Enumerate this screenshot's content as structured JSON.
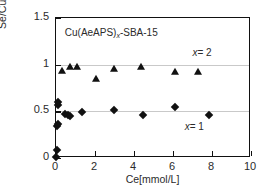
{
  "chart_data": {
    "type": "scatter",
    "title": "Cu(AeAPS)x-SBA-15",
    "title_base": "Cu(AeAPS)",
    "title_sub": "x",
    "title_tail": "-SBA-15",
    "xlabel": "Ce[mmol/L]",
    "ylabel": "Se/Cu[mol/mol]",
    "xlim": [
      0,
      10
    ],
    "ylim": [
      0,
      1.5
    ],
    "xticks": [
      0,
      2,
      4,
      6,
      8,
      10
    ],
    "xticklabels": [
      "0",
      "2",
      "4",
      "6",
      "8",
      "10"
    ],
    "yticks": [
      0,
      0.5,
      1,
      1.5
    ],
    "yticklabels": [
      "0",
      "0.5",
      "1",
      "1.5"
    ],
    "gridlines": [
      0.5,
      1.0
    ],
    "grid": "horizontal-only",
    "legend": "none",
    "annotations": [
      {
        "text": "x = 2",
        "label_var": "x",
        "label_val": "= 2",
        "x": 7.0,
        "y": 1.12
      },
      {
        "text": "x = 1",
        "label_var": "x",
        "label_val": "= 1",
        "x": 6.6,
        "y": 0.33
      }
    ],
    "series": [
      {
        "name": "x = 2",
        "marker": "triangle",
        "color": "#111111",
        "points": [
          {
            "x": 0.3,
            "y": 0.93
          },
          {
            "x": 0.72,
            "y": 0.97
          },
          {
            "x": 1.1,
            "y": 0.98
          },
          {
            "x": 2.05,
            "y": 0.85
          },
          {
            "x": 2.95,
            "y": 0.95
          },
          {
            "x": 4.35,
            "y": 0.98
          },
          {
            "x": 6.1,
            "y": 0.92
          },
          {
            "x": 7.3,
            "y": 0.92
          }
        ]
      },
      {
        "name": "x = 1",
        "marker": "diamond",
        "color": "#111111",
        "points": [
          {
            "x": 0.02,
            "y": 0.01
          },
          {
            "x": 0.03,
            "y": 0.09
          },
          {
            "x": 0.05,
            "y": 0.34
          },
          {
            "x": 0.08,
            "y": 0.36
          },
          {
            "x": 0.1,
            "y": 0.57
          },
          {
            "x": 0.12,
            "y": 0.6
          },
          {
            "x": 0.48,
            "y": 0.47
          },
          {
            "x": 0.62,
            "y": 0.46
          },
          {
            "x": 0.7,
            "y": 0.45
          },
          {
            "x": 1.35,
            "y": 0.49
          },
          {
            "x": 2.95,
            "y": 0.51
          },
          {
            "x": 4.45,
            "y": 0.46
          },
          {
            "x": 6.1,
            "y": 0.55
          },
          {
            "x": 7.85,
            "y": 0.46
          }
        ]
      }
    ]
  }
}
